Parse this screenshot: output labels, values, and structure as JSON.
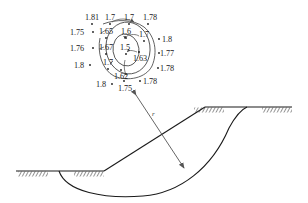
{
  "figure": {
    "type": "slope-stability-diagram",
    "title": "",
    "radius_label": "r",
    "stroke_color": "#1a1a1a",
    "text_color": "#1a1a1a"
  },
  "grid_labels": [
    {
      "id": "g0",
      "value": "1.81",
      "x": 85,
      "y": 14,
      "dot_x": 92,
      "dot_y": 24,
      "anchor": "left"
    },
    {
      "id": "g1",
      "value": "1.7",
      "x": 105,
      "y": 14,
      "dot_x": 110,
      "dot_y": 24,
      "anchor": "left"
    },
    {
      "id": "g2",
      "value": "1.7",
      "x": 124,
      "y": 14,
      "dot_x": 129,
      "dot_y": 24,
      "anchor": "left"
    },
    {
      "id": "g3",
      "value": "1.78",
      "x": 143,
      "y": 14,
      "dot_x": 148,
      "dot_y": 24,
      "anchor": "left"
    },
    {
      "id": "g4",
      "value": "1.75",
      "x": 70,
      "y": 29,
      "dot_x": 93,
      "dot_y": 32,
      "anchor": "left"
    },
    {
      "id": "g5",
      "value": "1.65",
      "x": 99,
      "y": 28,
      "dot_x": 106,
      "dot_y": 38,
      "anchor": "left"
    },
    {
      "id": "g6",
      "value": "1.6",
      "x": 121,
      "y": 28,
      "dot_x": 126,
      "dot_y": 38,
      "anchor": "left"
    },
    {
      "id": "g7",
      "value": "1.7",
      "x": 139,
      "y": 31,
      "dot_x": 144,
      "dot_y": 41,
      "anchor": "left"
    },
    {
      "id": "g8",
      "value": "1.8",
      "x": 162,
      "y": 36,
      "dot_x": 159,
      "dot_y": 39,
      "anchor": "left"
    },
    {
      "id": "g9",
      "value": "1.76",
      "x": 70,
      "y": 45,
      "dot_x": 93,
      "dot_y": 48,
      "anchor": "left"
    },
    {
      "id": "g10",
      "value": "1.67",
      "x": 99,
      "y": 44,
      "dot_x": 106,
      "dot_y": 54,
      "anchor": "left"
    },
    {
      "id": "g11",
      "value": "1.5",
      "x": 120,
      "y": 44,
      "dot_x": 126,
      "dot_y": 54,
      "anchor": "left"
    },
    {
      "id": "g12",
      "value": "1.63",
      "x": 133,
      "y": 55,
      "dot_x": 139,
      "dot_y": 52,
      "anchor": "left"
    },
    {
      "id": "g13",
      "value": "1.77",
      "x": 160,
      "y": 50,
      "dot_x": 159,
      "dot_y": 53,
      "anchor": "left"
    },
    {
      "id": "g14",
      "value": "1.7",
      "x": 103,
      "y": 59,
      "dot_x": 108,
      "dot_y": 69,
      "anchor": "left"
    },
    {
      "id": "g15",
      "value": "1.8",
      "x": 74,
      "y": 62,
      "dot_x": 90,
      "dot_y": 65,
      "anchor": "left"
    },
    {
      "id": "g16",
      "value": "1.78",
      "x": 160,
      "y": 65,
      "dot_x": 158,
      "dot_y": 68,
      "anchor": "left"
    },
    {
      "id": "g17",
      "value": "1.62",
      "x": 114,
      "y": 73,
      "dot_x": 121,
      "dot_y": 70,
      "anchor": "left"
    },
    {
      "id": "g18",
      "value": "1.8",
      "x": 96,
      "y": 81,
      "dot_x": 112,
      "dot_y": 84,
      "anchor": "left"
    },
    {
      "id": "g19",
      "value": "1.75",
      "x": 118,
      "y": 85,
      "dot_x": 124,
      "dot_y": 81,
      "anchor": "left"
    },
    {
      "id": "g20",
      "value": "1.78",
      "x": 143,
      "y": 78,
      "dot_x": 140,
      "dot_y": 81,
      "anchor": "left"
    }
  ],
  "chart_data": {
    "type": "contour-grid",
    "minimum_value": 1.5,
    "values": [
      1.81,
      1.7,
      1.7,
      1.78,
      1.75,
      1.65,
      1.6,
      1.7,
      1.8,
      1.76,
      1.67,
      1.5,
      1.63,
      1.77,
      1.7,
      1.8,
      1.78,
      1.62,
      1.8,
      1.75,
      1.78
    ],
    "contours": [
      1.5,
      1.6,
      1.7
    ]
  }
}
